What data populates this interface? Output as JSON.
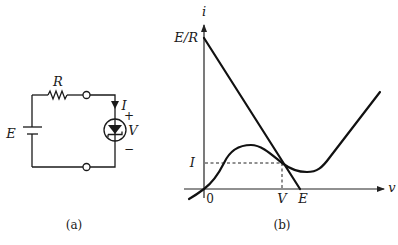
{
  "figure_a": {
    "caption": "(a)",
    "labels": {
      "resistor": "R",
      "source": "E",
      "current": "I",
      "voltage": "V",
      "plus": "+",
      "minus": "−"
    }
  },
  "figure_b": {
    "caption": "(b)",
    "axis_labels": {
      "y": "i",
      "x": "v"
    },
    "tick_labels": {
      "y_top": "E/R",
      "y_operating": "I",
      "x_origin": "0",
      "x_operating": "V",
      "x_source": "E"
    },
    "curves": [
      {
        "name": "load-line",
        "description": "straight line from (0, E/R) to (E, 0)"
      },
      {
        "name": "tunnel-diode-characteristic",
        "description": "N-shaped curve with peak, valley and rising region"
      }
    ],
    "operating_point": {
      "v": "V",
      "i": "I"
    }
  }
}
